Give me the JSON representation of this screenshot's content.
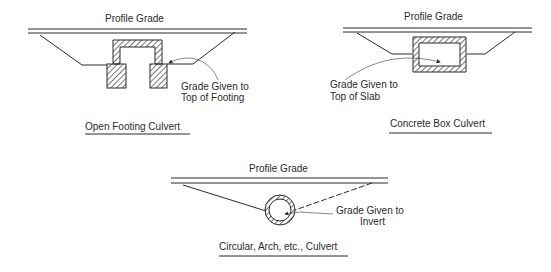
{
  "diagrams": [
    {
      "id": "open-footing",
      "profile_label": "Profile Grade",
      "note_line1": "Grade Given to",
      "note_line2": "Top of Footing",
      "title": "Open Footing Culvert"
    },
    {
      "id": "concrete-box",
      "profile_label": "Profile Grade",
      "note_line1": "Grade Given to",
      "note_line2": "Top of Slab",
      "title": "Concrete Box Culvert"
    },
    {
      "id": "circular",
      "profile_label": "Profile Grade",
      "note_line1": "Grade Given to",
      "note_line2": "Invert",
      "title": "Circular, Arch, etc., Culvert"
    }
  ],
  "colors": {
    "ink": "#2a2a2a",
    "background": "#ffffff"
  }
}
